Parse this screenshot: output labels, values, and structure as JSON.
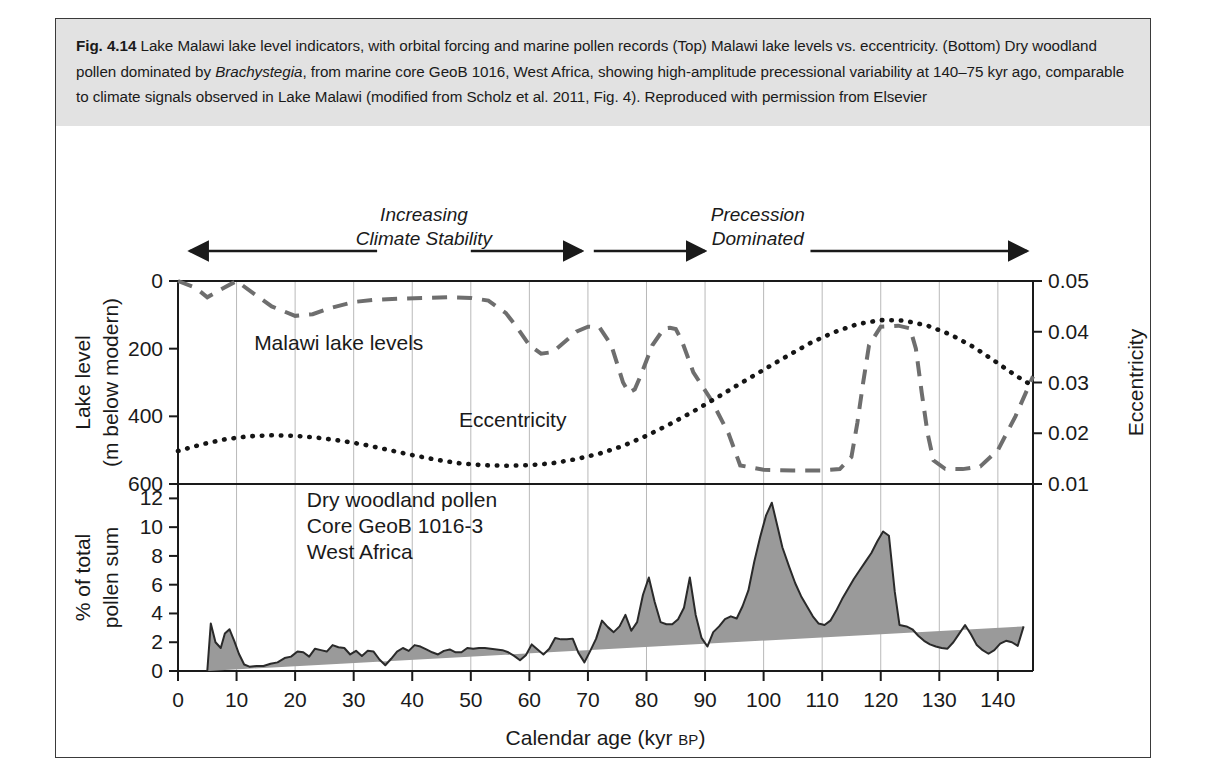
{
  "caption": {
    "figure_number": "Fig. 4.14",
    "line1": " Lake Malawi lake level indicators, with orbital forcing and marine pollen records (Top) Malawi lake levels vs. eccentricity. (Bottom) Dry woodland pollen dominated by ",
    "species": "Brachystegia",
    "line2": ", from marine core GeoB 1016, West Africa, showing high-amplitude precessional variability at 140–75 kyr ago, comparable to climate signals observed in Lake Malawi (modified from Scholz et al. 2011, Fig. 4). Reproduced with permission from Elsevier"
  },
  "annotations": {
    "left_line1": "Increasing",
    "left_line2": "Climate Stability",
    "right_line1": "Precession",
    "right_line2": "Dominated"
  },
  "axes": {
    "x_title_main": "Calendar age (kyr ",
    "x_title_sc": "BP",
    "x_title_end": ")",
    "x_ticks": [
      0,
      10,
      20,
      30,
      40,
      50,
      60,
      70,
      80,
      90,
      100,
      110,
      120,
      130,
      140
    ],
    "x_min": 0,
    "x_max": 146,
    "top_left_title_line1": "Lake level",
    "top_left_title_line2": "(m below modern)",
    "top_left_ticks": [
      0,
      200,
      400,
      600
    ],
    "top_left_min": 0,
    "top_left_max": 600,
    "top_right_title": "Eccentricity",
    "top_right_ticks": [
      "0.05",
      "0.04",
      "0.03",
      "0.02",
      "0.01"
    ],
    "top_right_min": 0.01,
    "top_right_max": 0.05,
    "bottom_title_line1": "% of total",
    "bottom_title_line2": "pollen sum",
    "bottom_ticks": [
      0,
      2,
      4,
      6,
      8,
      10,
      12
    ],
    "bottom_min": 0,
    "bottom_max": 13
  },
  "series_labels": {
    "lake": "Malawi lake levels",
    "eccentricity": "Eccentricity",
    "pollen_line1": "Dry woodland pollen",
    "pollen_line2": "Core GeoB 1016-3",
    "pollen_line3": "West Africa"
  },
  "colors": {
    "caption_band": "#e2e2e2",
    "frame": "#3a3a3a",
    "gridline": "#b9b9b9",
    "axis": "#1a1a1a",
    "lake_dashed": "#6e6e6e",
    "eccentricity_dotted": "#151515",
    "pollen_fill": "#9a9a9a",
    "pollen_stroke": "#2a2a2a"
  },
  "chart_data": [
    {
      "type": "line",
      "title": "Malawi lake levels vs. eccentricity",
      "xlabel": "Calendar age (kyr BP)",
      "ylabel": "Lake level (m below modern)",
      "y2label": "Eccentricity",
      "xlim": [
        0,
        146
      ],
      "ylim": [
        600,
        0
      ],
      "y2lim": [
        0.01,
        0.05
      ],
      "grid": true,
      "legend": "in-plot labels",
      "series": [
        {
          "name": "Malawi lake levels",
          "style": "dashed",
          "units": "m below modern",
          "x": [
            0,
            3,
            5,
            7,
            10,
            13,
            16,
            20,
            23,
            26,
            30,
            34,
            38,
            42,
            46,
            50,
            53,
            56,
            58,
            60,
            62,
            64,
            66,
            68,
            70,
            72,
            74,
            76,
            77,
            78,
            79,
            81,
            83,
            84,
            85,
            86,
            88,
            91,
            94,
            96,
            100,
            105,
            110,
            113,
            115,
            116,
            117,
            118,
            120,
            123,
            125,
            126,
            127,
            128,
            129,
            131,
            134,
            137,
            140,
            143,
            146
          ],
          "y": [
            0,
            20,
            48,
            28,
            0,
            38,
            75,
            103,
            98,
            80,
            62,
            55,
            52,
            50,
            48,
            50,
            58,
            95,
            140,
            190,
            215,
            210,
            180,
            150,
            135,
            138,
            190,
            300,
            330,
            320,
            280,
            190,
            140,
            138,
            142,
            175,
            270,
            350,
            450,
            545,
            558,
            560,
            560,
            556,
            520,
            420,
            300,
            190,
            135,
            132,
            140,
            200,
            330,
            450,
            530,
            555,
            556,
            548,
            500,
            400,
            282
          ]
        },
        {
          "name": "Eccentricity",
          "style": "dotted",
          "x": [
            0,
            4,
            8,
            12,
            16,
            20,
            24,
            28,
            32,
            36,
            40,
            44,
            48,
            52,
            56,
            60,
            64,
            68,
            72,
            76,
            80,
            84,
            88,
            92,
            96,
            100,
            104,
            108,
            112,
            116,
            120,
            124,
            128,
            132,
            136,
            140,
            143,
            146
          ],
          "y": [
            0.0165,
            0.0178,
            0.0188,
            0.0194,
            0.0196,
            0.0195,
            0.0191,
            0.0185,
            0.0177,
            0.0167,
            0.0157,
            0.0148,
            0.0141,
            0.0137,
            0.0136,
            0.0137,
            0.0141,
            0.0149,
            0.016,
            0.0175,
            0.0195,
            0.0218,
            0.0243,
            0.027,
            0.0298,
            0.0325,
            0.0352,
            0.0378,
            0.0399,
            0.0415,
            0.0423,
            0.0422,
            0.0412,
            0.0394,
            0.0369,
            0.0338,
            0.0314,
            0.0293
          ]
        }
      ]
    },
    {
      "type": "area",
      "title": "Dry woodland pollen, Core GeoB 1016-3, West Africa",
      "xlabel": "Calendar age (kyr BP)",
      "ylabel": "% of total pollen sum",
      "xlim": [
        0,
        146
      ],
      "ylim": [
        0,
        13
      ],
      "grid": true,
      "series": [
        {
          "name": "Dry woodland pollen",
          "x": [
            5.0,
            5.6,
            6.4,
            7.3,
            8.0,
            8.8,
            9.6,
            10.4,
            11.3,
            12.2,
            13.4,
            14.6,
            15.8,
            17.0,
            18.2,
            19.3,
            20.4,
            21.4,
            22.4,
            23.4,
            24.4,
            25.4,
            26.4,
            27.4,
            28.4,
            29.4,
            30.4,
            31.4,
            32.4,
            33.4,
            34.4,
            35.4,
            36.4,
            37.4,
            38.4,
            39.4,
            40.4,
            41.4,
            42.4,
            43.4,
            44.4,
            45.4,
            46.4,
            47.4,
            48.4,
            49.4,
            50.4,
            51.4,
            52.4,
            53.4,
            54.4,
            55.4,
            56.4,
            57.4,
            58.4,
            59.4,
            60.4,
            61.4,
            62.4,
            63.4,
            64.4,
            65.4,
            66.4,
            67.4,
            68.4,
            69.4,
            70.4,
            71.4,
            72.4,
            73.4,
            74.4,
            75.4,
            76.4,
            77.4,
            78.4,
            79.4,
            80.4,
            81.4,
            82.4,
            83.4,
            84.4,
            85.4,
            86.4,
            87.4,
            88.4,
            89.4,
            90.4,
            91.4,
            92.4,
            93.4,
            94.4,
            95.4,
            96.4,
            97.4,
            98.4,
            99.4,
            100.4,
            101.4,
            102.4,
            103.2,
            104.4,
            105.4,
            106.4,
            107.4,
            108.4,
            109.4,
            110.4,
            111.4,
            112.4,
            113.4,
            114.4,
            115.4,
            116.4,
            117.4,
            118.4,
            119.4,
            120.4,
            121.4,
            122.4,
            123.2,
            124.4,
            125.4,
            126.4,
            127.4,
            128.4,
            129.4,
            130.4,
            131.4,
            132.4,
            133.4,
            134.4,
            135.4,
            136.4,
            137.4,
            138.4,
            139.4,
            140.4,
            141.4,
            142.4,
            143.4,
            144.4,
            145.4,
            146.0
          ],
          "y": [
            0.0,
            3.3,
            2.0,
            1.6,
            2.6,
            2.9,
            2.1,
            1.2,
            0.45,
            0.3,
            0.35,
            0.35,
            0.5,
            0.6,
            0.9,
            1.0,
            1.35,
            1.3,
            1.0,
            1.55,
            1.45,
            1.35,
            1.8,
            1.65,
            1.6,
            1.15,
            1.4,
            1.05,
            1.4,
            1.35,
            0.8,
            0.4,
            0.85,
            1.35,
            1.6,
            1.4,
            1.8,
            1.7,
            1.5,
            1.3,
            1.15,
            1.4,
            1.5,
            1.3,
            1.3,
            1.6,
            1.55,
            1.6,
            1.6,
            1.55,
            1.5,
            1.45,
            1.3,
            1.05,
            0.75,
            1.1,
            1.85,
            1.5,
            1.15,
            1.55,
            2.3,
            2.2,
            2.2,
            2.25,
            1.25,
            0.6,
            1.4,
            2.25,
            3.5,
            3.05,
            2.7,
            3.1,
            3.9,
            2.8,
            3.4,
            5.3,
            6.5,
            4.8,
            3.4,
            3.25,
            3.25,
            3.6,
            4.4,
            6.5,
            3.9,
            2.3,
            1.7,
            2.7,
            3.1,
            3.6,
            3.8,
            3.65,
            4.5,
            5.6,
            7.6,
            9.3,
            10.8,
            11.7,
            10.0,
            8.6,
            7.2,
            6.1,
            5.2,
            4.5,
            3.8,
            3.3,
            3.2,
            3.5,
            4.2,
            5.0,
            5.7,
            6.4,
            7.0,
            7.6,
            8.2,
            9.0,
            9.7,
            9.4,
            5.5,
            3.2,
            3.1,
            2.9,
            2.45,
            2.1,
            1.85,
            1.7,
            1.6,
            1.55,
            2.0,
            2.6,
            3.2,
            2.55,
            1.8,
            1.45,
            1.2,
            1.45,
            1.9,
            2.1,
            2.0,
            1.75,
            3.1
          ]
        }
      ]
    }
  ]
}
